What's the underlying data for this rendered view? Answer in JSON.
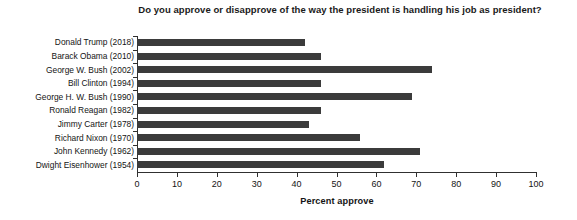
{
  "chart_data": {
    "type": "bar",
    "orientation": "horizontal",
    "title": "Do you approve or disapprove of the way the president is handling his job as president?",
    "xlabel": "Percent approve",
    "ylabel": "",
    "xlim": [
      0,
      100
    ],
    "xticks": [
      "0",
      "10",
      "20",
      "30",
      "40",
      "50",
      "60",
      "70",
      "80",
      "90",
      "100"
    ],
    "grid": false,
    "legend": null,
    "bar_color": "#3b3b3b",
    "axis_color": "#303030",
    "categories": [
      "Donald Trump (2018)",
      "Barack Obama (2010)",
      "George W. Bush (2002)",
      "Bill Clinton (1994)",
      "George H. W. Bush (1990)",
      "Ronald Reagan (1982)",
      "Jimmy Carter (1978)",
      "Richard Nixon (1970)",
      "John Kennedy (1962)",
      "Dwight Eisenhower (1954)"
    ],
    "values": [
      42,
      46,
      74,
      46,
      69,
      46,
      43,
      56,
      71,
      62
    ]
  }
}
